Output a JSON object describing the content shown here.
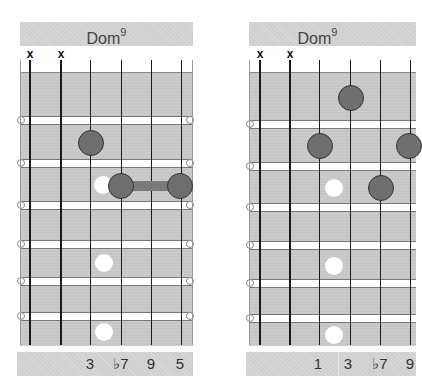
{
  "diagrams": [
    {
      "title": "Dom",
      "title_sup": "9",
      "muted_strings": [
        "x",
        "x"
      ],
      "intervals": [
        "3",
        "♭7",
        "9",
        "5"
      ]
    },
    {
      "title": "Dom",
      "title_sup": "9",
      "muted_strings": [
        "x",
        "x"
      ],
      "intervals": [
        "1",
        "3",
        "♭7",
        "9"
      ]
    }
  ],
  "colors": {
    "board": "#c6c6c6",
    "header": "#cfcfcf",
    "finger_dot": "#6e6e6e",
    "inlay": "#ffffff",
    "string": "#1a1a1a"
  }
}
